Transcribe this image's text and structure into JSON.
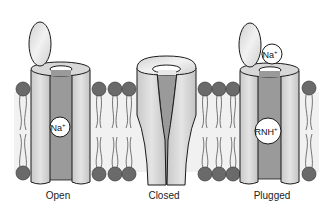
{
  "diagram": {
    "colors": {
      "lipid_head": "#6a6a6a",
      "tube": "#d6d6d6",
      "pore": "#9a9a9a",
      "outline": "#1a1a1a",
      "gate": "#e6e6e6"
    },
    "channels": [
      {
        "id": "open",
        "label": "Open",
        "ions": [
          {
            "text": "Na",
            "charge": "+"
          }
        ]
      },
      {
        "id": "closed",
        "label": "Closed",
        "ions": []
      },
      {
        "id": "plugged",
        "label": "Plugged",
        "ions": [
          {
            "text": "Na",
            "charge": "+"
          },
          {
            "text": "RNH",
            "charge": "+"
          }
        ]
      }
    ]
  }
}
